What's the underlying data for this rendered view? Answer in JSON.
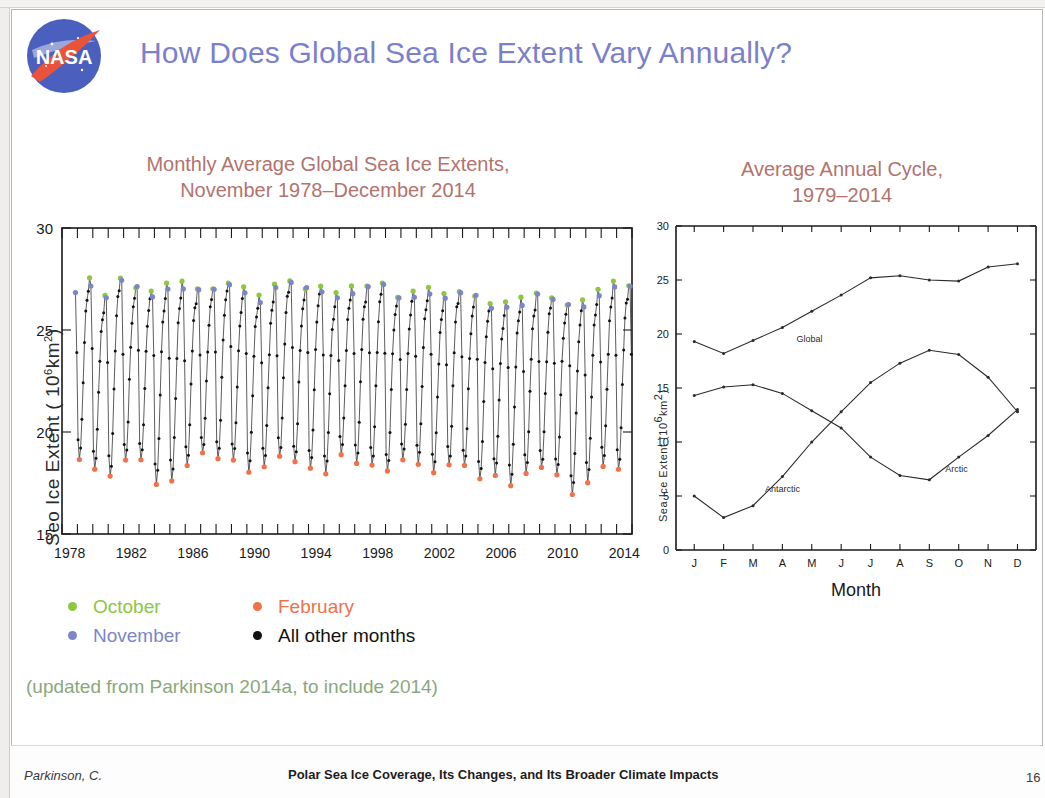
{
  "slide": {
    "title": "How Does Global Sea Ice Extent Vary Annually?",
    "title_color": "#7b7fcc",
    "logo_name": "NASA"
  },
  "left_panel": {
    "subtitle_line1": "Monthly Average Global Sea Ice Extents,",
    "subtitle_line2": "November 1978–December 2014",
    "subtitle_color": "#b2736e"
  },
  "right_panel": {
    "subtitle_line1": "Average Annual Cycle,",
    "subtitle_line2": "1979–2014"
  },
  "legend": {
    "items": [
      {
        "label": "October",
        "color": "#8dc63f"
      },
      {
        "label": "February",
        "color": "#f0714a"
      },
      {
        "label": "November",
        "color": "#7b86c9"
      },
      {
        "label": "All other months",
        "color": "#111111"
      }
    ]
  },
  "note": {
    "text": "(updated from Parkinson 2014a, to include 2014)",
    "color": "#8aa87c"
  },
  "footer": {
    "author": "Parkinson, C.",
    "title": "Polar Sea Ice Coverage, Its Changes, and Its Broader Climate Impacts",
    "page": "16"
  },
  "chart_data": [
    {
      "id": "monthly-global-sea-ice-extent",
      "type": "line",
      "title": "Monthly Average Global Sea Ice Extents, November 1978–December 2014",
      "xlabel": "",
      "ylabel": "Seo Ice Extent ( 10⁶ km²)",
      "ylabel_plain": "Sea Ice Extent (10^6 km^2)",
      "xlim": [
        1978.0,
        2015.0
      ],
      "ylim": [
        15,
        30
      ],
      "yticks": [
        15,
        20,
        25,
        30
      ],
      "xticks": [
        1978,
        1982,
        1986,
        1990,
        1994,
        1998,
        2002,
        2006,
        2010,
        2014
      ],
      "xminor_step": 1,
      "grid": false,
      "point_categories": {
        "October": "#8dc63f",
        "November": "#7b86c9",
        "February": "#f0714a",
        "All other months": "#111111"
      },
      "series_note": "Monthly global (Arctic + Antarctic) sea ice extent, Nov 1978 through Dec 2014; annual maxima in Oct/Nov, minima in Feb.",
      "annual_maxima": [
        {
          "year": 1979,
          "value": 27.5
        },
        {
          "year": 1980,
          "value": 26.6
        },
        {
          "year": 1981,
          "value": 27.6
        },
        {
          "year": 1982,
          "value": 27.2
        },
        {
          "year": 1983,
          "value": 26.9
        },
        {
          "year": 1984,
          "value": 27.3
        },
        {
          "year": 1985,
          "value": 27.2
        },
        {
          "year": 1986,
          "value": 27.1
        },
        {
          "year": 1987,
          "value": 27.0
        },
        {
          "year": 1988,
          "value": 27.5
        },
        {
          "year": 1989,
          "value": 27.0
        },
        {
          "year": 1990,
          "value": 26.7
        },
        {
          "year": 1991,
          "value": 27.1
        },
        {
          "year": 1992,
          "value": 27.5
        },
        {
          "year": 1993,
          "value": 27.1
        },
        {
          "year": 1994,
          "value": 27.2
        },
        {
          "year": 1995,
          "value": 26.8
        },
        {
          "year": 1996,
          "value": 27.0
        },
        {
          "year": 1997,
          "value": 27.2
        },
        {
          "year": 1998,
          "value": 27.3
        },
        {
          "year": 1999,
          "value": 26.8
        },
        {
          "year": 2000,
          "value": 26.8
        },
        {
          "year": 2001,
          "value": 27.1
        },
        {
          "year": 2002,
          "value": 26.6
        },
        {
          "year": 2003,
          "value": 27.0
        },
        {
          "year": 2004,
          "value": 26.7
        },
        {
          "year": 2005,
          "value": 26.4
        },
        {
          "year": 2006,
          "value": 26.3
        },
        {
          "year": 2007,
          "value": 26.5
        },
        {
          "year": 2008,
          "value": 26.8
        },
        {
          "year": 2009,
          "value": 26.6
        },
        {
          "year": 2010,
          "value": 26.4
        },
        {
          "year": 2011,
          "value": 26.4
        },
        {
          "year": 2012,
          "value": 27.0
        },
        {
          "year": 2013,
          "value": 27.2
        },
        {
          "year": 2014,
          "value": 27.3
        }
      ],
      "annual_minima": [
        {
          "year": 1979,
          "value": 18.7
        },
        {
          "year": 1980,
          "value": 18.2
        },
        {
          "year": 1981,
          "value": 17.8
        },
        {
          "year": 1982,
          "value": 18.6
        },
        {
          "year": 1983,
          "value": 18.6
        },
        {
          "year": 1984,
          "value": 17.5
        },
        {
          "year": 1985,
          "value": 17.6
        },
        {
          "year": 1986,
          "value": 18.4
        },
        {
          "year": 1987,
          "value": 18.9
        },
        {
          "year": 1988,
          "value": 18.7
        },
        {
          "year": 1989,
          "value": 18.6
        },
        {
          "year": 1990,
          "value": 18.1
        },
        {
          "year": 1991,
          "value": 18.3
        },
        {
          "year": 1992,
          "value": 18.8
        },
        {
          "year": 1993,
          "value": 18.5
        },
        {
          "year": 1994,
          "value": 18.2
        },
        {
          "year": 1995,
          "value": 18.0
        },
        {
          "year": 1996,
          "value": 18.9
        },
        {
          "year": 1997,
          "value": 18.5
        },
        {
          "year": 1998,
          "value": 18.3
        },
        {
          "year": 1999,
          "value": 18.1
        },
        {
          "year": 2000,
          "value": 18.6
        },
        {
          "year": 2001,
          "value": 18.5
        },
        {
          "year": 2002,
          "value": 18.0
        },
        {
          "year": 2003,
          "value": 18.4
        },
        {
          "year": 2004,
          "value": 18.3
        },
        {
          "year": 2005,
          "value": 17.7
        },
        {
          "year": 2006,
          "value": 17.9
        },
        {
          "year": 2007,
          "value": 17.4
        },
        {
          "year": 2008,
          "value": 18.0
        },
        {
          "year": 2009,
          "value": 18.2
        },
        {
          "year": 2010,
          "value": 17.9
        },
        {
          "year": 2011,
          "value": 16.9
        },
        {
          "year": 2012,
          "value": 17.6
        },
        {
          "year": 2013,
          "value": 18.3
        },
        {
          "year": 2014,
          "value": 18.2
        }
      ]
    },
    {
      "id": "average-annual-cycle",
      "type": "line",
      "title": "Average Annual Cycle, 1979–2014",
      "xlabel": "Month",
      "ylabel": "Sea Ice Extent (10⁶ km²)",
      "categories": [
        "J",
        "F",
        "M",
        "A",
        "M",
        "J",
        "J",
        "A",
        "S",
        "O",
        "N",
        "D"
      ],
      "ylim": [
        0,
        30
      ],
      "yticks": [
        0,
        5,
        10,
        15,
        20,
        25,
        30
      ],
      "grid": false,
      "series": [
        {
          "name": "Global",
          "label_at": "M",
          "values": [
            19.3,
            18.2,
            19.4,
            20.6,
            22.1,
            23.6,
            25.2,
            25.4,
            25.0,
            24.9,
            26.2,
            26.5,
            23.3
          ]
        },
        {
          "name": "Antarctic",
          "label_at": "A",
          "values": [
            5.0,
            3.0,
            4.1,
            6.8,
            10.0,
            12.8,
            15.5,
            17.3,
            18.5,
            18.1,
            16.0,
            12.8
          ]
        },
        {
          "name": "Arctic",
          "label_at": "S",
          "values": [
            14.3,
            15.1,
            15.3,
            14.5,
            12.9,
            11.3,
            8.6,
            6.9,
            6.5,
            8.6,
            10.6,
            13.0
          ]
        }
      ],
      "series_fix_note": "Global has 12 monthly values; Jan–Dec."
    }
  ]
}
